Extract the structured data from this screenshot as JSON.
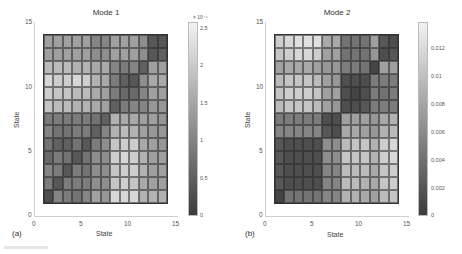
{
  "chart_data": [
    {
      "type": "heatmap",
      "panel_label": "(a)",
      "title": "Mode 1",
      "xlabel": "State",
      "ylabel": "State",
      "xlim": [
        0,
        15
      ],
      "ylim": [
        0,
        15
      ],
      "x_ticks": [
        "0",
        "5",
        "10",
        "15"
      ],
      "y_ticks": [
        "0",
        "5",
        "10",
        "15"
      ],
      "grid_size": [
        13,
        13
      ],
      "row_order": "top-to-bottom (state 13 to state 1)",
      "colorbar": {
        "min": 0,
        "max": 2.6e-05,
        "exponent_label": "× 10⁻⁵",
        "ticks": [
          "0",
          "0.5",
          "1",
          "1.5",
          "2",
          "2.5"
        ],
        "colormap": "gray"
      },
      "values_normalized": [
        [
          0.55,
          0.55,
          0.55,
          0.55,
          0.55,
          0.4,
          0.4,
          0.55,
          0.55,
          0.55,
          0.45,
          0.15,
          0.15
        ],
        [
          0.55,
          0.55,
          0.55,
          0.55,
          0.55,
          0.45,
          0.45,
          0.55,
          0.55,
          0.55,
          0.45,
          0.15,
          0.2
        ],
        [
          0.7,
          0.7,
          0.7,
          0.65,
          0.65,
          0.6,
          0.6,
          0.4,
          0.35,
          0.4,
          0.2,
          0.55,
          0.55
        ],
        [
          0.85,
          0.8,
          0.8,
          0.85,
          0.8,
          0.65,
          0.6,
          0.35,
          0.2,
          0.15,
          0.45,
          0.6,
          0.6
        ],
        [
          0.8,
          0.75,
          0.75,
          0.7,
          0.7,
          0.6,
          0.55,
          0.35,
          0.25,
          0.25,
          0.4,
          0.55,
          0.55
        ],
        [
          0.75,
          0.7,
          0.7,
          0.65,
          0.65,
          0.6,
          0.55,
          0.2,
          0.35,
          0.4,
          0.4,
          0.5,
          0.5
        ],
        [
          0.35,
          0.35,
          0.35,
          0.35,
          0.35,
          0.3,
          0.2,
          0.65,
          0.6,
          0.6,
          0.55,
          0.55,
          0.5
        ],
        [
          0.4,
          0.3,
          0.3,
          0.35,
          0.35,
          0.2,
          0.4,
          0.65,
          0.7,
          0.65,
          0.55,
          0.5,
          0.5
        ],
        [
          0.3,
          0.2,
          0.2,
          0.3,
          0.15,
          0.35,
          0.45,
          0.75,
          0.8,
          0.8,
          0.6,
          0.55,
          0.5
        ],
        [
          0.25,
          0.35,
          0.3,
          0.15,
          0.3,
          0.45,
          0.45,
          0.8,
          0.85,
          0.8,
          0.65,
          0.55,
          0.55
        ],
        [
          0.4,
          0.35,
          0.15,
          0.35,
          0.3,
          0.45,
          0.45,
          0.75,
          0.8,
          0.8,
          0.65,
          0.55,
          0.55
        ],
        [
          0.35,
          0.15,
          0.35,
          0.35,
          0.35,
          0.45,
          0.45,
          0.75,
          0.8,
          0.75,
          0.6,
          0.55,
          0.55
        ],
        [
          0.1,
          0.4,
          0.35,
          0.3,
          0.4,
          0.55,
          0.5,
          0.85,
          0.85,
          0.85,
          0.65,
          0.65,
          0.65
        ]
      ]
    },
    {
      "type": "heatmap",
      "panel_label": "(b)",
      "title": "Mode 2",
      "xlabel": "State",
      "ylabel": "State",
      "xlim": [
        0,
        15
      ],
      "ylim": [
        0,
        15
      ],
      "x_ticks": [
        "0",
        "5",
        "10",
        "15"
      ],
      "y_ticks": [
        "0",
        "5",
        "10",
        "15"
      ],
      "grid_size": [
        13,
        13
      ],
      "row_order": "top-to-bottom (state 13 to state 1)",
      "colorbar": {
        "min": 0,
        "max": 0.0135,
        "exponent_label": "",
        "ticks": [
          "0",
          "0.002",
          "0.004",
          "0.006",
          "0.008",
          "0.01",
          "0.012"
        ],
        "colormap": "gray"
      },
      "values_normalized": [
        [
          0.8,
          0.85,
          0.9,
          0.9,
          0.9,
          0.6,
          0.6,
          0.3,
          0.3,
          0.3,
          0.55,
          0.15,
          0.1
        ],
        [
          0.75,
          0.8,
          0.85,
          0.85,
          0.8,
          0.55,
          0.55,
          0.3,
          0.3,
          0.3,
          0.5,
          0.1,
          0.15
        ],
        [
          0.55,
          0.6,
          0.6,
          0.6,
          0.55,
          0.5,
          0.5,
          0.35,
          0.35,
          0.3,
          0.05,
          0.55,
          0.55
        ],
        [
          0.7,
          0.75,
          0.75,
          0.75,
          0.7,
          0.55,
          0.5,
          0.1,
          0.1,
          0.1,
          0.35,
          0.35,
          0.35
        ],
        [
          0.75,
          0.8,
          0.8,
          0.8,
          0.75,
          0.55,
          0.55,
          0.1,
          0.05,
          0.1,
          0.35,
          0.3,
          0.35
        ],
        [
          0.7,
          0.75,
          0.75,
          0.75,
          0.7,
          0.55,
          0.5,
          0.1,
          0.1,
          0.15,
          0.35,
          0.35,
          0.35
        ],
        [
          0.35,
          0.35,
          0.35,
          0.35,
          0.35,
          0.1,
          0.1,
          0.55,
          0.55,
          0.55,
          0.5,
          0.6,
          0.65
        ],
        [
          0.4,
          0.4,
          0.4,
          0.4,
          0.4,
          0.15,
          0.1,
          0.6,
          0.6,
          0.55,
          0.5,
          0.65,
          0.7
        ],
        [
          0.15,
          0.1,
          0.1,
          0.1,
          0.1,
          0.45,
          0.45,
          0.7,
          0.75,
          0.75,
          0.65,
          0.8,
          0.85
        ],
        [
          0.15,
          0.1,
          0.1,
          0.1,
          0.1,
          0.45,
          0.45,
          0.75,
          0.75,
          0.75,
          0.65,
          0.8,
          0.85
        ],
        [
          0.15,
          0.1,
          0.1,
          0.1,
          0.1,
          0.4,
          0.4,
          0.7,
          0.7,
          0.7,
          0.6,
          0.75,
          0.8
        ],
        [
          0.15,
          0.1,
          0.1,
          0.1,
          0.1,
          0.4,
          0.4,
          0.7,
          0.7,
          0.65,
          0.6,
          0.75,
          0.8
        ],
        [
          0.05,
          0.3,
          0.3,
          0.3,
          0.3,
          0.4,
          0.4,
          0.65,
          0.65,
          0.6,
          0.55,
          0.7,
          0.75
        ]
      ]
    }
  ]
}
